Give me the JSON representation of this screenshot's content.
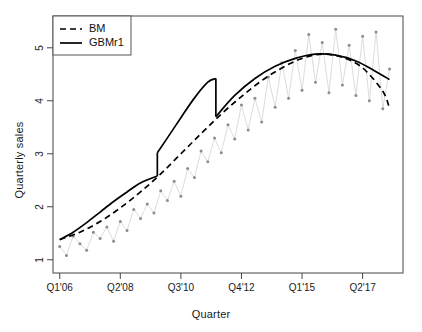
{
  "chart_data": {
    "type": "line",
    "title": "",
    "xlabel": "Quarter",
    "ylabel": "Quarterly sales",
    "xtick_labels": [
      "Q1'06",
      "Q2'08",
      "Q3'10",
      "Q4'12",
      "Q1'15",
      "Q2'17"
    ],
    "xtick_values": [
      1,
      10,
      19,
      28,
      37,
      46
    ],
    "ytick_labels": [
      "1",
      "2",
      "3",
      "4",
      "5"
    ],
    "ytick_values": [
      1,
      2,
      3,
      4,
      5
    ],
    "xlim": [
      0,
      52
    ],
    "ylim": [
      0.75,
      5.6
    ],
    "grid": false,
    "legend": {
      "position": "top-left",
      "entries": [
        {
          "label": "BM",
          "style": "dashed",
          "color": "#000000"
        },
        {
          "label": "GBMr1",
          "style": "solid",
          "color": "#000000"
        }
      ]
    },
    "series": [
      {
        "name": "observed",
        "type": "scatter-line",
        "color": "#9a9a9a",
        "x": [
          1,
          2,
          3,
          4,
          5,
          6,
          7,
          8,
          9,
          10,
          11,
          12,
          13,
          14,
          15,
          16,
          17,
          18,
          19,
          20,
          21,
          22,
          23,
          24,
          25,
          26,
          27,
          28,
          29,
          30,
          31,
          32,
          33,
          34,
          35,
          36,
          37,
          38,
          39,
          40,
          41,
          42,
          43,
          44,
          45,
          46,
          47,
          48,
          49,
          50
        ],
        "y": [
          1.25,
          1.08,
          1.45,
          1.3,
          1.18,
          1.52,
          1.4,
          1.62,
          1.35,
          1.72,
          1.55,
          1.95,
          1.78,
          2.05,
          1.88,
          2.3,
          2.12,
          2.48,
          2.2,
          2.72,
          2.55,
          3.05,
          2.85,
          3.3,
          3.02,
          3.55,
          3.28,
          3.92,
          3.45,
          4.05,
          3.6,
          4.45,
          3.88,
          4.72,
          4.05,
          4.95,
          4.2,
          5.25,
          4.35,
          5.1,
          4.15,
          5.35,
          4.3,
          5.05,
          4.1,
          5.22,
          4.0,
          5.3,
          3.85,
          4.6
        ]
      },
      {
        "name": "BM",
        "type": "line",
        "style": "dashed",
        "color": "#000000",
        "x": [
          1,
          4,
          7,
          10,
          13,
          16,
          19,
          22,
          25,
          28,
          31,
          34,
          37,
          40,
          43,
          46,
          49,
          50
        ],
        "y": [
          1.38,
          1.52,
          1.72,
          1.98,
          2.28,
          2.62,
          3.0,
          3.38,
          3.75,
          4.08,
          4.38,
          4.62,
          4.8,
          4.88,
          4.82,
          4.62,
          4.18,
          3.85
        ]
      },
      {
        "name": "GBMr1",
        "type": "line-with-jumps",
        "style": "solid",
        "color": "#000000",
        "jumps": [
          {
            "x": 15.5,
            "from": 2.58,
            "to": 3.02
          },
          {
            "x": 24.2,
            "from": 4.42,
            "to": 3.7
          }
        ],
        "segments": [
          {
            "x": [
              1,
              3,
              5,
              7,
              9,
              11,
              13,
              15.5
            ],
            "y": [
              1.38,
              1.52,
              1.7,
              1.9,
              2.1,
              2.28,
              2.45,
              2.58
            ]
          },
          {
            "x": [
              15.5,
              17,
              19,
              21,
              23,
              24.2
            ],
            "y": [
              3.02,
              3.3,
              3.68,
              4.05,
              4.35,
              4.42
            ]
          },
          {
            "x": [
              24.2,
              27,
              30,
              33,
              36,
              39,
              42,
              45,
              48,
              50
            ],
            "y": [
              3.7,
              4.1,
              4.42,
              4.65,
              4.8,
              4.88,
              4.86,
              4.75,
              4.55,
              4.4
            ]
          }
        ]
      }
    ]
  }
}
